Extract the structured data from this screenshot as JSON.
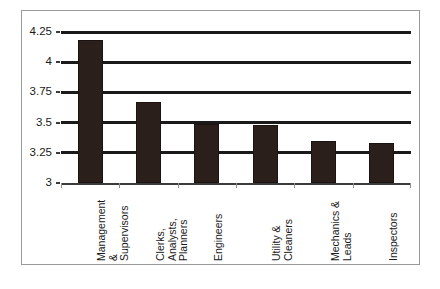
{
  "chart_data": {
    "type": "bar",
    "title": "",
    "subtitle": "",
    "xlabel": "",
    "ylabel": "",
    "categories": [
      "Management\n&\nSupervisors",
      "Clerks,\nAnalysts,\nPlanners",
      "Engineers",
      "Utility &\nCleaners",
      "Mechanics &\nLeads",
      "Inspectors"
    ],
    "values": [
      4.18,
      3.67,
      3.49,
      3.48,
      3.35,
      3.33
    ],
    "ylim": [
      3,
      4.25
    ],
    "yticks": [
      3,
      3.25,
      3.5,
      3.75,
      4,
      4.25
    ],
    "ytick_labels": [
      "3",
      "3.25",
      "3.5",
      "3.75",
      "4",
      "4.25"
    ],
    "grid": true,
    "legend": false,
    "legend_position": "none",
    "bar_color": "#2b1f1c",
    "gridline_color": "#1a1a1a",
    "frame_color": "#9a9a9a",
    "background_color": "#ffffff"
  }
}
